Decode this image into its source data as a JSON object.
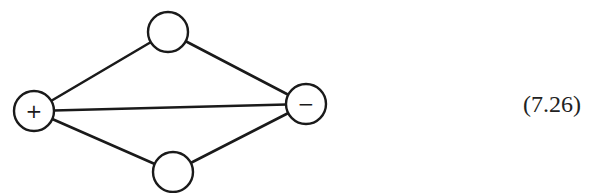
{
  "diagram": {
    "type": "graph",
    "nodes": [
      {
        "id": "plus",
        "label": "+",
        "cx": 34,
        "cy": 111,
        "r": 20
      },
      {
        "id": "top",
        "label": "",
        "cx": 168,
        "cy": 32,
        "r": 20
      },
      {
        "id": "minus",
        "label": "−",
        "cx": 306,
        "cy": 104,
        "r": 20
      },
      {
        "id": "bottom",
        "label": "",
        "cx": 173,
        "cy": 172,
        "r": 20
      }
    ],
    "edges": [
      [
        "plus",
        "top"
      ],
      [
        "top",
        "minus"
      ],
      [
        "plus",
        "minus"
      ],
      [
        "plus",
        "bottom"
      ],
      [
        "bottom",
        "minus"
      ]
    ],
    "stroke_color": "#1a1a1a"
  },
  "equation_number": "(7.26)"
}
